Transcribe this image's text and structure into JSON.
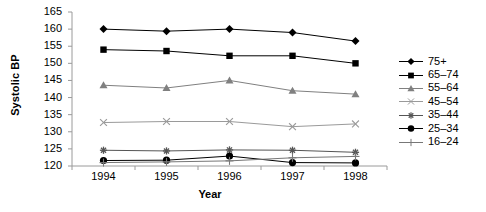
{
  "chart_data": {
    "type": "line",
    "title": "",
    "xlabel": "Year",
    "ylabel": "Systolic BP",
    "categories": [
      "1994",
      "1995",
      "1996",
      "1997",
      "1998"
    ],
    "x": [
      1994,
      1995,
      1996,
      1997,
      1998
    ],
    "ylim": [
      120,
      165
    ],
    "yticks": [
      120,
      125,
      130,
      135,
      140,
      145,
      150,
      155,
      160,
      165
    ],
    "grid": false,
    "legend_position": "right",
    "series": [
      {
        "name": "75+",
        "marker": "diamond",
        "color": "#000000",
        "values": [
          160.0,
          159.4,
          160.0,
          159.0,
          156.5
        ]
      },
      {
        "name": "65–74",
        "marker": "square",
        "color": "#000000",
        "values": [
          154.0,
          153.6,
          152.2,
          152.2,
          150.0
        ]
      },
      {
        "name": "55–64",
        "marker": "triangle",
        "color": "#808080",
        "values": [
          143.6,
          142.8,
          145.0,
          142.0,
          141.0
        ]
      },
      {
        "name": "45–54",
        "marker": "cross",
        "color": "#9a9a9a",
        "values": [
          132.7,
          133.0,
          133.0,
          131.5,
          132.3
        ]
      },
      {
        "name": "35–44",
        "marker": "star",
        "color": "#555555",
        "values": [
          124.6,
          124.4,
          124.7,
          124.6,
          124.0
        ]
      },
      {
        "name": "25–34",
        "marker": "circle",
        "color": "#000000",
        "values": [
          121.6,
          121.7,
          122.9,
          121.0,
          120.9
        ]
      },
      {
        "name": "16–24",
        "marker": "plus",
        "color": "#777777",
        "values": [
          121.0,
          121.2,
          121.5,
          122.4,
          122.8
        ]
      }
    ]
  },
  "axis": {
    "y_title": "Systolic BP",
    "x_title": "Year"
  },
  "legend": {
    "items": [
      {
        "label": "75+"
      },
      {
        "label": "65–74"
      },
      {
        "label": "55–64"
      },
      {
        "label": "45–54"
      },
      {
        "label": "35–44"
      },
      {
        "label": "25–34"
      },
      {
        "label": "16–24"
      }
    ]
  }
}
